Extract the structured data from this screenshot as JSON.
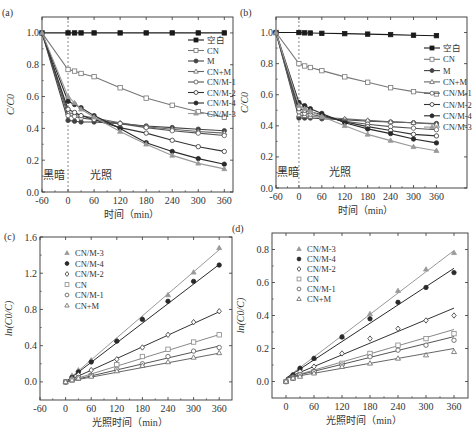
{
  "figure": {
    "panel_labels": [
      "(a)",
      "(b)",
      "(c)",
      "(d)"
    ],
    "dark_label": "黑暗",
    "light_label": "光照"
  },
  "chart_data": [
    {
      "id": "a",
      "type": "line",
      "title": "(a)",
      "xlabel": "时间（min）",
      "ylabel": "C/C0",
      "xlim": [
        -60,
        380
      ],
      "ylim": [
        0.0,
        1.1
      ],
      "xticks": [
        -60,
        0,
        60,
        120,
        180,
        240,
        300,
        360
      ],
      "yticks": [
        0.0,
        0.2,
        0.4,
        0.6,
        0.8,
        1.0
      ],
      "ytick_format": 1,
      "dashed_vline_x": 0,
      "annotations": [
        {
          "text": "黑暗",
          "x": -58,
          "y": 0.08
        },
        {
          "text": "光照",
          "x": 50,
          "y": 0.08
        }
      ],
      "legend": {
        "position": "upper-right",
        "entries": [
          "空白",
          "CN",
          "M",
          "CN+M",
          "CN/M-1",
          "CN/M-2",
          "CN/M-4",
          "CN/M-3"
        ]
      },
      "x": [
        -60,
        0,
        15,
        30,
        60,
        120,
        180,
        240,
        300,
        360
      ],
      "series": [
        {
          "name": "空白",
          "marker": "square-filled",
          "color": "#1a1a1a",
          "values": [
            1.0,
            1.0,
            1.0,
            1.0,
            1.0,
            1.0,
            1.0,
            1.0,
            1.0,
            1.0
          ]
        },
        {
          "name": "CN",
          "marker": "square-open",
          "color": "#777777",
          "values": [
            1.0,
            0.77,
            0.76,
            0.745,
            0.725,
            0.655,
            0.59,
            0.545,
            0.505,
            0.47
          ]
        },
        {
          "name": "M",
          "marker": "circle-filled",
          "color": "#444444",
          "values": [
            1.0,
            0.45,
            0.445,
            0.44,
            0.44,
            0.43,
            0.415,
            0.405,
            0.395,
            0.385
          ]
        },
        {
          "name": "CN+M",
          "marker": "triangle-open",
          "color": "#666666",
          "values": [
            1.0,
            0.5,
            0.49,
            0.48,
            0.465,
            0.435,
            0.41,
            0.395,
            0.38,
            0.37
          ]
        },
        {
          "name": "CN/M-1",
          "marker": "circle-open",
          "color": "#555555",
          "values": [
            1.0,
            0.48,
            0.475,
            0.465,
            0.455,
            0.43,
            0.405,
            0.385,
            0.37,
            0.355
          ]
        },
        {
          "name": "CN/M-2",
          "marker": "circle-open",
          "color": "#333333",
          "values": [
            1.0,
            0.52,
            0.5,
            0.48,
            0.455,
            0.405,
            0.37,
            0.325,
            0.285,
            0.255
          ]
        },
        {
          "name": "CN/M-4",
          "marker": "circle-filled",
          "color": "#2a2a2a",
          "values": [
            1.0,
            0.57,
            0.55,
            0.53,
            0.48,
            0.4,
            0.31,
            0.255,
            0.21,
            0.175
          ]
        },
        {
          "name": "CN/M-3",
          "marker": "triangle-filled",
          "color": "#999999",
          "values": [
            1.0,
            0.6,
            0.56,
            0.52,
            0.47,
            0.38,
            0.3,
            0.23,
            0.18,
            0.145
          ]
        }
      ]
    },
    {
      "id": "b",
      "type": "line",
      "title": "(b)",
      "xlabel": "时间（min）",
      "ylabel": "C/C0",
      "xlim": [
        -60,
        440
      ],
      "ylim": [
        0.0,
        1.1
      ],
      "xticks": [
        -60,
        0,
        60,
        120,
        180,
        240,
        300,
        360
      ],
      "yticks": [
        0.0,
        0.2,
        0.4,
        0.6,
        0.8,
        1.0
      ],
      "ytick_format": 1,
      "dashed_vline_x": 0,
      "annotations": [
        {
          "text": "黑暗",
          "x": -58,
          "y": 0.08
        },
        {
          "text": "光照",
          "x": 80,
          "y": 0.08
        }
      ],
      "legend": {
        "position": "right",
        "entries": [
          "空白",
          "CN",
          "M",
          "CN+M",
          "CN/M-1",
          "CN/M-2",
          "CN/M-4",
          "CN/M-3"
        ]
      },
      "x": [
        -60,
        0,
        15,
        30,
        60,
        120,
        180,
        240,
        300,
        360
      ],
      "series": [
        {
          "name": "空白",
          "marker": "square-filled",
          "color": "#1a1a1a",
          "values": [
            1.0,
            1.0,
            0.998,
            0.997,
            0.995,
            0.993,
            0.99,
            0.987,
            0.983,
            0.98
          ]
        },
        {
          "name": "CN",
          "marker": "square-open",
          "color": "#777777",
          "values": [
            1.0,
            0.8,
            0.785,
            0.775,
            0.755,
            0.715,
            0.68,
            0.645,
            0.62,
            0.605
          ]
        },
        {
          "name": "M",
          "marker": "circle-filled",
          "color": "#444444",
          "values": [
            1.0,
            0.45,
            0.45,
            0.45,
            0.445,
            0.44,
            0.43,
            0.425,
            0.42,
            0.415
          ]
        },
        {
          "name": "CN+M",
          "marker": "triangle-open",
          "color": "#666666",
          "values": [
            1.0,
            0.47,
            0.465,
            0.46,
            0.455,
            0.445,
            0.435,
            0.425,
            0.42,
            0.41
          ]
        },
        {
          "name": "CN/M-1",
          "marker": "circle-open",
          "color": "#555555",
          "values": [
            1.0,
            0.49,
            0.48,
            0.475,
            0.46,
            0.43,
            0.41,
            0.395,
            0.385,
            0.375
          ]
        },
        {
          "name": "CN/M-2",
          "marker": "circle-open",
          "color": "#333333",
          "values": [
            1.0,
            0.51,
            0.5,
            0.49,
            0.47,
            0.425,
            0.395,
            0.37,
            0.345,
            0.335
          ]
        },
        {
          "name": "CN/M-4",
          "marker": "circle-filled",
          "color": "#2a2a2a",
          "values": [
            1.0,
            0.55,
            0.53,
            0.51,
            0.48,
            0.42,
            0.38,
            0.35,
            0.315,
            0.29
          ]
        },
        {
          "name": "CN/M-3",
          "marker": "triangle-filled",
          "color": "#999999",
          "values": [
            1.0,
            0.53,
            0.51,
            0.495,
            0.46,
            0.4,
            0.345,
            0.305,
            0.265,
            0.24
          ]
        }
      ]
    },
    {
      "id": "c",
      "type": "scatter",
      "title": "(c)",
      "xlabel": "光照时间（min）",
      "ylabel": "ln(C0/C)",
      "xlim": [
        -60,
        390
      ],
      "ylim": [
        -0.2,
        1.6
      ],
      "xticks": [
        -60,
        0,
        60,
        120,
        180,
        240,
        300,
        360
      ],
      "yticks": [
        0.0,
        0.4,
        0.8,
        1.2,
        1.6
      ],
      "ytick_format": 1,
      "fit_lines": true,
      "legend": {
        "position": "upper-left",
        "entries": [
          "CN/M-3",
          "CN/M-4",
          "CN/M-2",
          "CN",
          "CN/M-1",
          "CN+M"
        ]
      },
      "x": [
        0,
        15,
        30,
        60,
        120,
        180,
        240,
        300,
        360
      ],
      "series": [
        {
          "name": "CN/M-3",
          "marker": "triangle-filled",
          "color": "#999999",
          "slope": 0.00405,
          "values": [
            0.0,
            0.07,
            0.13,
            0.24,
            0.46,
            0.7,
            0.96,
            1.21,
            1.48
          ]
        },
        {
          "name": "CN/M-4",
          "marker": "circle-filled",
          "color": "#2a2a2a",
          "slope": 0.0036,
          "values": [
            0.0,
            0.05,
            0.11,
            0.22,
            0.45,
            0.69,
            0.89,
            1.11,
            1.29
          ]
        },
        {
          "name": "CN/M-2",
          "marker": "diamond-open",
          "color": "#333333",
          "slope": 0.00215,
          "values": [
            0.0,
            0.04,
            0.08,
            0.13,
            0.25,
            0.38,
            0.52,
            0.66,
            0.78
          ]
        },
        {
          "name": "CN",
          "marker": "square-open",
          "color": "#888888",
          "slope": 0.00145,
          "values": [
            0.0,
            0.02,
            0.04,
            0.07,
            0.19,
            0.28,
            0.36,
            0.44,
            0.52
          ]
        },
        {
          "name": "CN/M-1",
          "marker": "circle-open",
          "color": "#555555",
          "slope": 0.0011,
          "values": [
            0.0,
            0.03,
            0.05,
            0.07,
            0.14,
            0.2,
            0.28,
            0.34,
            0.38
          ]
        },
        {
          "name": "CN+M",
          "marker": "triangle-open",
          "color": "#666666",
          "slope": 0.00088,
          "values": [
            0.0,
            0.02,
            0.04,
            0.06,
            0.12,
            0.18,
            0.22,
            0.27,
            0.32
          ]
        }
      ]
    },
    {
      "id": "d",
      "type": "scatter",
      "title": "(d)",
      "xlabel": "光照时间（min）",
      "ylabel": "ln(C0/C)",
      "xlim": [
        -30,
        390
      ],
      "ylim": [
        -0.1,
        0.9
      ],
      "xticks": [
        0,
        60,
        120,
        180,
        240,
        300,
        360
      ],
      "yticks": [
        0.0,
        0.2,
        0.4,
        0.6,
        0.8
      ],
      "ytick_format": 1,
      "fit_lines": true,
      "legend": {
        "position": "upper-left",
        "entries": [
          "CN/M-3",
          "CN/M-4",
          "CN/M-2",
          "CN",
          "CN/M-1",
          "CN+M"
        ]
      },
      "x": [
        0,
        15,
        30,
        60,
        120,
        180,
        240,
        300,
        360
      ],
      "series": [
        {
          "name": "CN/M-3",
          "marker": "triangle-filled",
          "color": "#999999",
          "slope": 0.00215,
          "intercept": 0.02,
          "values": [
            0.0,
            0.04,
            0.08,
            0.14,
            0.27,
            0.41,
            0.55,
            0.68,
            0.78
          ]
        },
        {
          "name": "CN/M-4",
          "marker": "circle-filled",
          "color": "#2a2a2a",
          "slope": 0.00185,
          "intercept": 0.02,
          "values": [
            0.0,
            0.04,
            0.08,
            0.14,
            0.27,
            0.38,
            0.48,
            0.57,
            0.66
          ]
        },
        {
          "name": "CN/M-2",
          "marker": "diamond-open",
          "color": "#333333",
          "slope": 0.00118,
          "intercept": 0.02,
          "values": [
            0.0,
            0.03,
            0.06,
            0.09,
            0.17,
            0.26,
            0.32,
            0.37,
            0.4
          ]
        },
        {
          "name": "CN",
          "marker": "square-open",
          "color": "#888888",
          "slope": 0.00082,
          "intercept": 0.02,
          "values": [
            0.0,
            0.02,
            0.04,
            0.06,
            0.11,
            0.17,
            0.22,
            0.26,
            0.29
          ]
        },
        {
          "name": "CN/M-1",
          "marker": "circle-open",
          "color": "#555555",
          "slope": 0.0007,
          "intercept": 0.02,
          "values": [
            0.0,
            0.02,
            0.04,
            0.06,
            0.1,
            0.15,
            0.19,
            0.22,
            0.25
          ]
        },
        {
          "name": "CN+M",
          "marker": "triangle-open",
          "color": "#666666",
          "slope": 0.0005,
          "intercept": 0.02,
          "values": [
            0.0,
            0.02,
            0.03,
            0.05,
            0.09,
            0.11,
            0.14,
            0.16,
            0.18
          ]
        }
      ]
    }
  ]
}
